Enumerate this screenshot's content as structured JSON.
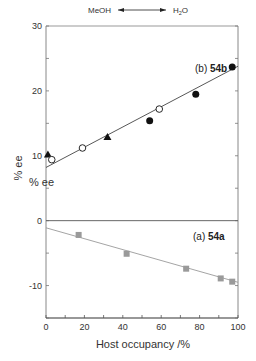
{
  "chart_data": {
    "type": "scatter",
    "title": "",
    "xlabel": "Host occupancy /%",
    "ylabel": "% ee",
    "ylabel_duplicate": "% ee",
    "xlim": [
      0,
      100
    ],
    "ylim": [
      -15,
      30
    ],
    "x_ticks": [
      0,
      20,
      40,
      60,
      80,
      100
    ],
    "y_ticks": [
      -10,
      0,
      10,
      20,
      30
    ],
    "y_tick_labels": [
      "-10",
      "0",
      "10",
      "20",
      "30"
    ],
    "x_tick_labels": [
      "0",
      "20",
      "40",
      "60",
      "80",
      "100"
    ],
    "solvent_annotation": {
      "left": "MeOH",
      "right": "H2O",
      "right_main": "H",
      "right_sub": "2",
      "right_tail": "O"
    },
    "panels": [
      {
        "label_prefix": "(b) ",
        "label_bold": "54b"
      },
      {
        "label_prefix": "(a) ",
        "label_bold": "54a"
      }
    ],
    "series": [
      {
        "name": "54b triangles",
        "marker": "filled-triangle",
        "color": "#111111",
        "points": [
          [
            1,
            10.2
          ],
          [
            32,
            12.9
          ]
        ]
      },
      {
        "name": "54b open circles",
        "marker": "open-circle",
        "color": "#111111",
        "points": [
          [
            3,
            9.4
          ],
          [
            19,
            11.2
          ],
          [
            59,
            17.2
          ]
        ]
      },
      {
        "name": "54b filled circles",
        "marker": "filled-circle",
        "color": "#111111",
        "points": [
          [
            54,
            15.4
          ],
          [
            78,
            19.5
          ],
          [
            97,
            23.7
          ]
        ]
      },
      {
        "name": "54a squares",
        "marker": "filled-square",
        "color": "#9a9a9a",
        "points": [
          [
            17,
            -2.2
          ],
          [
            42,
            -5.1
          ],
          [
            73,
            -7.4
          ],
          [
            91,
            -8.9
          ],
          [
            97,
            -9.4
          ]
        ]
      }
    ],
    "fit_lines": [
      {
        "name": "54b fit",
        "color": "#444444",
        "from": [
          0,
          8.2
        ],
        "to": [
          100,
          23.8
        ]
      },
      {
        "name": "54a fit",
        "color": "#9a9a9a",
        "from": [
          0,
          -1.1
        ],
        "to": [
          100,
          -9.5
        ]
      }
    ],
    "zero_line": {
      "y": 0,
      "color": "#666666"
    },
    "grid": false,
    "legend": "none"
  }
}
